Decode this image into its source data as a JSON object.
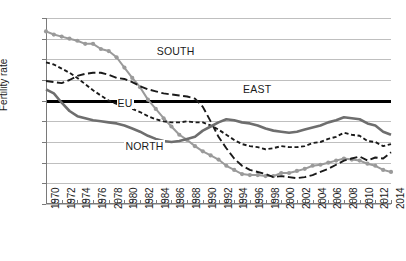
{
  "chart_data": {
    "type": "line",
    "title": "",
    "xlabel": "",
    "ylabel": "Fertility rate",
    "xlim": [
      1970,
      2014
    ],
    "ylim": [
      1,
      2.8
    ],
    "ytick_step": 0.2,
    "decimal_separator": ",",
    "grid": "horizontal",
    "legend_position": "inline-annotations",
    "emphasized_gridline": 2,
    "x": [
      1970,
      1971,
      1972,
      1973,
      1974,
      1975,
      1976,
      1977,
      1978,
      1979,
      1980,
      1981,
      1982,
      1983,
      1984,
      1985,
      1986,
      1987,
      1988,
      1989,
      1990,
      1991,
      1992,
      1993,
      1994,
      1995,
      1996,
      1997,
      1998,
      1999,
      2000,
      2001,
      2002,
      2003,
      2004,
      2005,
      2006,
      2007,
      2008,
      2009,
      2010,
      2011,
      2012,
      2013,
      2014
    ],
    "xtick_labels": [
      "1970",
      "1972",
      "1974",
      "1976",
      "2078",
      "1980",
      "1982",
      "1984",
      "1986",
      "1988",
      "1990",
      "1992",
      "1994",
      "1996",
      "1998",
      "2000",
      "2002",
      "2004",
      "2006",
      "2008",
      "2010",
      "2012",
      "2014"
    ],
    "ytick_labels": [
      "1",
      "1,2",
      "1,4",
      "1,6",
      "1,8",
      "2",
      "2,2",
      "2,4",
      "2,6",
      "2,8"
    ],
    "series": [
      {
        "name": "SOUTH",
        "style": "solid-with-round-markers",
        "color": "#9a9a9a",
        "values": [
          2.67,
          2.64,
          2.62,
          2.6,
          2.58,
          2.55,
          2.55,
          2.5,
          2.48,
          2.42,
          2.32,
          2.22,
          2.13,
          2.01,
          1.92,
          1.83,
          1.75,
          1.67,
          1.62,
          1.56,
          1.51,
          1.47,
          1.43,
          1.37,
          1.33,
          1.29,
          1.28,
          1.28,
          1.27,
          1.27,
          1.3,
          1.3,
          1.32,
          1.34,
          1.37,
          1.38,
          1.4,
          1.42,
          1.44,
          1.43,
          1.42,
          1.39,
          1.37,
          1.33,
          1.31
        ]
      },
      {
        "name": "EU",
        "style": "short-dashed",
        "color": "#1a1a1a",
        "values": [
          2.37,
          2.35,
          2.31,
          2.27,
          2.22,
          2.16,
          2.1,
          2.05,
          2.0,
          1.97,
          1.95,
          1.92,
          1.89,
          1.85,
          1.82,
          1.8,
          1.79,
          1.79,
          1.8,
          1.79,
          1.79,
          1.76,
          1.72,
          1.67,
          1.62,
          1.58,
          1.56,
          1.55,
          1.53,
          1.54,
          1.56,
          1.55,
          1.55,
          1.56,
          1.59,
          1.6,
          1.63,
          1.65,
          1.69,
          1.67,
          1.66,
          1.61,
          1.6,
          1.56,
          1.58
        ]
      },
      {
        "name": "EAST",
        "style": "long-dashed",
        "color": "#1a1a1a",
        "values": [
          2.19,
          2.18,
          2.17,
          2.2,
          2.24,
          2.26,
          2.27,
          2.27,
          2.25,
          2.22,
          2.21,
          2.18,
          2.14,
          2.11,
          2.09,
          2.07,
          2.06,
          2.05,
          2.04,
          2.02,
          1.94,
          1.8,
          1.65,
          1.54,
          1.44,
          1.37,
          1.33,
          1.31,
          1.29,
          1.26,
          1.27,
          1.26,
          1.25,
          1.26,
          1.28,
          1.31,
          1.34,
          1.38,
          1.42,
          1.44,
          1.46,
          1.42,
          1.45,
          1.44,
          1.5
        ]
      },
      {
        "name": "NORTH",
        "style": "solid-thick",
        "color": "#6e6e6e",
        "values": [
          2.11,
          2.07,
          1.98,
          1.9,
          1.85,
          1.83,
          1.81,
          1.8,
          1.79,
          1.78,
          1.76,
          1.73,
          1.7,
          1.66,
          1.63,
          1.61,
          1.6,
          1.61,
          1.63,
          1.65,
          1.71,
          1.75,
          1.79,
          1.82,
          1.81,
          1.79,
          1.78,
          1.76,
          1.73,
          1.71,
          1.7,
          1.69,
          1.7,
          1.72,
          1.74,
          1.76,
          1.79,
          1.81,
          1.84,
          1.83,
          1.82,
          1.78,
          1.76,
          1.7,
          1.67
        ]
      }
    ],
    "annotations": [
      {
        "text": "SOUTH",
        "near_x": 1984,
        "near_y": 2.47
      },
      {
        "text": "EAST",
        "near_x": 1995,
        "near_y": 2.1
      },
      {
        "text": "EU",
        "near_x": 1979,
        "near_y": 1.97
      },
      {
        "text": "NORTH",
        "near_x": 1980,
        "near_y": 1.55
      }
    ]
  }
}
